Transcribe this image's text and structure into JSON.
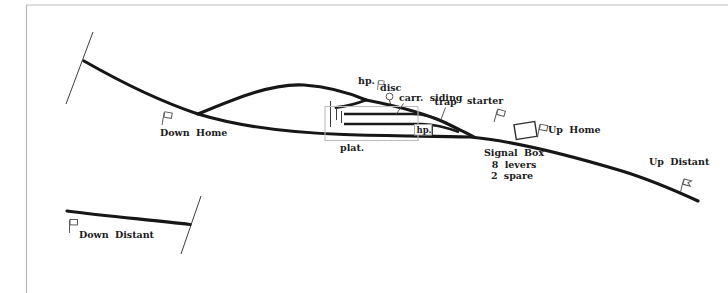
{
  "diagram": {
    "labels": {
      "down_home": "Down Home",
      "down_distant": "Down Distant",
      "up_home": "Up Home",
      "up_distant": "Up Distant",
      "starter": "starter",
      "trap": "trap",
      "disc": "disc",
      "hp_upper": "hp.",
      "hp_platform": "hp.",
      "carr_siding": "carr. siding",
      "platform": "plat.",
      "signal_box_line1": "Signal Box",
      "signal_box_line2": "8 levers",
      "signal_box_line3": "2 spare"
    },
    "signals": [
      {
        "name": "down-home-signal",
        "type": "home-flag",
        "label": "Down Home"
      },
      {
        "name": "down-distant-signal",
        "type": "distant-flag",
        "label": "Down Distant"
      },
      {
        "name": "up-home-signal",
        "type": "home-flag",
        "label": "Up Home"
      },
      {
        "name": "up-distant-signal",
        "type": "distant-fishtail-flag",
        "label": "Up Distant"
      },
      {
        "name": "starter-signal",
        "type": "home-flag",
        "label": "starter"
      },
      {
        "name": "disc-signal",
        "type": "ground-disc",
        "label": "disc"
      },
      {
        "name": "hp-upper-signal",
        "type": "post",
        "label": "hp."
      },
      {
        "name": "hp-platform-signal",
        "type": "post",
        "label": "hp."
      }
    ],
    "signal_box": {
      "levers_total": 8,
      "levers_spare": 2
    },
    "colors": {
      "track": "#161616",
      "frame_border": "#b9b9b9",
      "platform_outline": "#bdbdbd",
      "signal_outline": "#5a5a5a",
      "text": "#1c1c1c",
      "background": "#ffffff"
    }
  }
}
